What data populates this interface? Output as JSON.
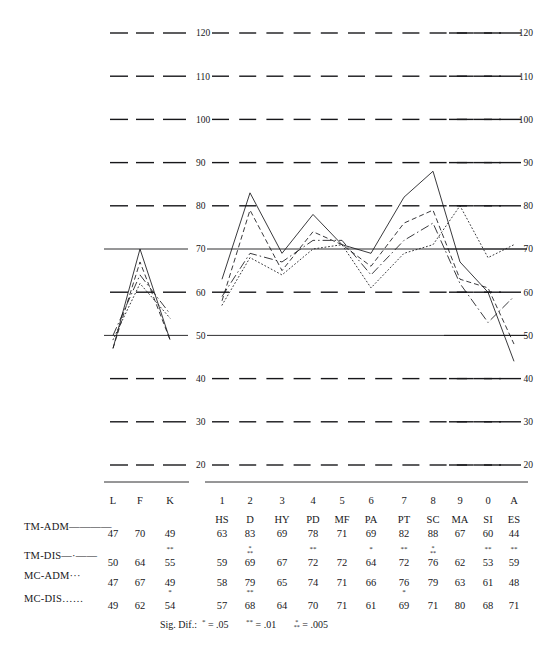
{
  "chart_data": {
    "type": "line",
    "title": "",
    "xlabel": "",
    "ylabel": "",
    "ylim": [
      20,
      120
    ],
    "yticks": [
      20,
      30,
      40,
      50,
      60,
      70,
      80,
      90,
      100,
      110,
      120
    ],
    "grid": "dashes at every 10; solid reference lines at 50 and 70",
    "legend_position": "left of data table",
    "panels": [
      {
        "name": "validity",
        "categories": [
          "L",
          "F",
          "K"
        ]
      },
      {
        "name": "clinical",
        "categories": [
          "HS",
          "D",
          "HY",
          "PD",
          "MF",
          "PA",
          "PT",
          "SC",
          "MA",
          "SI",
          "ES"
        ]
      }
    ],
    "scale_numbers": [
      "1",
      "2",
      "3",
      "4",
      "5",
      "6",
      "7",
      "8",
      "9",
      "0",
      "A"
    ],
    "series": [
      {
        "name": "TM-ADM",
        "style": "solid",
        "validity": [
          47,
          70,
          49
        ],
        "clinical": [
          63,
          83,
          69,
          78,
          71,
          69,
          82,
          88,
          67,
          60,
          44
        ]
      },
      {
        "name": "TM-DIS",
        "style": "dash-dot",
        "validity": [
          50,
          64,
          55
        ],
        "clinical": [
          59,
          69,
          67,
          72,
          72,
          64,
          72,
          76,
          62,
          53,
          59
        ]
      },
      {
        "name": "MC-ADM",
        "style": "dashed",
        "validity": [
          47,
          67,
          49
        ],
        "clinical": [
          58,
          79,
          65,
          74,
          71,
          66,
          76,
          79,
          63,
          61,
          48
        ]
      },
      {
        "name": "MC-DIS",
        "style": "dotted",
        "validity": [
          49,
          62,
          54
        ],
        "clinical": [
          57,
          68,
          64,
          70,
          71,
          61,
          69,
          71,
          80,
          68,
          71
        ]
      }
    ]
  },
  "axis": {
    "left_labels": [
      "120",
      "110",
      "100",
      "90",
      "80",
      "70",
      "60",
      "50",
      "40",
      "30",
      "20"
    ],
    "right_labels": [
      "120",
      "110",
      "100",
      "90",
      "80",
      "70",
      "60",
      "50",
      "40",
      "30",
      "20"
    ]
  },
  "table": {
    "validity_headers": [
      "L",
      "F",
      "K"
    ],
    "clinical_numbers": [
      "1",
      "2",
      "3",
      "4",
      "5",
      "6",
      "7",
      "8",
      "9",
      "0",
      "A"
    ],
    "clinical_abbrev": [
      "HS",
      "D",
      "HY",
      "PD",
      "MF",
      "PA",
      "PT",
      "SC",
      "MA",
      "SI",
      "ES"
    ],
    "rows": [
      {
        "label": "TM-ADM",
        "legend_style": "solid",
        "validity": [
          "47",
          "70",
          "49"
        ],
        "validity_sig": [
          "",
          "",
          ""
        ],
        "clinical": [
          "63",
          "83",
          "69",
          "78",
          "71",
          "69",
          "82",
          "88",
          "67",
          "60",
          "44"
        ],
        "clinical_sig": [
          "",
          "",
          "",
          "",
          "",
          "",
          "",
          "",
          "",
          "",
          ""
        ]
      },
      {
        "label": "TM-DIS",
        "legend_style": "dash-dot",
        "validity": [
          "50",
          "64",
          "55"
        ],
        "validity_sig": [
          "",
          "",
          "**"
        ],
        "clinical": [
          "59",
          "69",
          "67",
          "72",
          "72",
          "64",
          "72",
          "76",
          "62",
          "53",
          "59"
        ],
        "clinical_sig": [
          "",
          "***",
          "",
          "**",
          "",
          "*",
          "**",
          "***",
          "",
          "**",
          "**"
        ]
      },
      {
        "label": "MC-ADM",
        "legend_style": "dashed",
        "validity": [
          "47",
          "67",
          "49"
        ],
        "validity_sig": [
          "",
          "",
          ""
        ],
        "clinical": [
          "58",
          "79",
          "65",
          "74",
          "71",
          "66",
          "76",
          "79",
          "63",
          "61",
          "48"
        ],
        "clinical_sig": [
          "",
          "",
          "",
          "",
          "",
          "",
          "",
          "",
          "",
          "",
          ""
        ]
      },
      {
        "label": "MC-DIS",
        "legend_style": "dotted",
        "validity": [
          "49",
          "62",
          "54"
        ],
        "validity_sig": [
          "",
          "",
          "*"
        ],
        "clinical": [
          "57",
          "68",
          "64",
          "70",
          "71",
          "61",
          "69",
          "71",
          "80",
          "68",
          "71"
        ],
        "clinical_sig": [
          "",
          "**",
          "",
          "",
          "",
          "",
          "*",
          "",
          "",
          "",
          ""
        ]
      }
    ]
  },
  "footnote": {
    "prefix": "Sig. Dif.:",
    "items": [
      {
        "mark": "*",
        "eq": "=",
        "value": ".05"
      },
      {
        "mark": "**",
        "eq": "=",
        "value": ".01"
      },
      {
        "mark": "***",
        "eq": "=",
        "value": ".005"
      }
    ]
  },
  "colors": {
    "ink": "#17171a",
    "background": "#ffffff"
  }
}
